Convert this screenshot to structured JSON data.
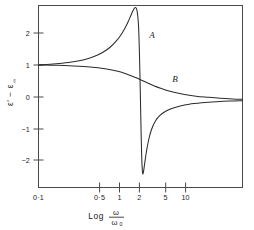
{
  "figure": {
    "title": "",
    "background_color": "#ffffff",
    "line_color": "#2b2b2b",
    "axis_color": "#4a4a4a"
  },
  "axes": {
    "x_title_prefix": "Log",
    "x_numerator": "ω",
    "x_denominator": "ω",
    "x_denominator_subscript": "0",
    "y_title": "ε' − ε",
    "y_title_subscript": "∞",
    "x_tick_labels": [
      "0·1",
      "0·5",
      "1",
      "2",
      "5",
      "10"
    ],
    "y_tick_labels": [
      "2",
      "1",
      "0",
      "−1",
      "−2"
    ]
  },
  "annotations": {
    "curve_a_label": "A",
    "curve_b_label": "B"
  },
  "chart_data": {
    "type": "line",
    "title": "",
    "xlabel": "Log ω/ω₀",
    "ylabel": "ε' − ε∞",
    "x_scale": "log",
    "xlim": [
      0.1,
      10
    ],
    "ylim": [
      -2.5,
      2.7
    ],
    "x_ticks": [
      0.1,
      0.5,
      1,
      2,
      5,
      10
    ],
    "y_ticks": [
      2,
      1,
      0,
      -1,
      -2
    ],
    "grid": false,
    "legend": "inline-labels",
    "series": [
      {
        "name": "A",
        "description": "Resonance absorption dispersion curve with sharp anomalous dispersion at omega/omega0 = 1",
        "label_position": {
          "x": 1.22,
          "y": 1.78
        },
        "x": [
          0.1,
          0.13,
          0.17,
          0.22,
          0.28,
          0.35,
          0.42,
          0.5,
          0.58,
          0.65,
          0.71,
          0.76,
          0.8,
          0.84,
          0.87,
          0.9,
          0.92,
          0.94,
          0.955,
          0.965,
          0.975,
          0.985,
          0.995,
          1.005,
          1.015,
          1.025,
          1.035,
          1.05,
          1.07,
          1.1,
          1.14,
          1.2,
          1.28,
          1.4,
          1.55,
          1.75,
          2.0,
          2.4,
          3.0,
          4.0,
          5.5,
          7.5,
          10.0
        ],
        "y": [
          1.0,
          1.02,
          1.05,
          1.09,
          1.15,
          1.24,
          1.35,
          1.5,
          1.69,
          1.88,
          2.07,
          2.25,
          2.4,
          2.54,
          2.62,
          2.64,
          2.58,
          2.4,
          2.15,
          1.85,
          1.4,
          0.85,
          0.25,
          -0.4,
          -1.0,
          -1.5,
          -1.85,
          -2.1,
          -2.05,
          -1.8,
          -1.5,
          -1.15,
          -0.85,
          -0.6,
          -0.44,
          -0.33,
          -0.25,
          -0.18,
          -0.12,
          -0.08,
          -0.05,
          -0.03,
          -0.02
        ]
      },
      {
        "name": "B",
        "description": "Debye relaxation dispersion curve, monotonic decrease from 1 to 0",
        "label_position": {
          "x": 2.05,
          "y": 0.52
        },
        "x": [
          0.1,
          0.15,
          0.22,
          0.32,
          0.45,
          0.6,
          0.75,
          0.9,
          1.0,
          1.15,
          1.35,
          1.6,
          1.9,
          2.3,
          2.8,
          3.5,
          4.5,
          6.0,
          8.0,
          10.0
        ],
        "y": [
          1.0,
          0.99,
          0.97,
          0.94,
          0.89,
          0.82,
          0.73,
          0.64,
          0.58,
          0.5,
          0.41,
          0.33,
          0.26,
          0.2,
          0.15,
          0.11,
          0.08,
          0.05,
          0.03,
          0.02
        ]
      }
    ]
  }
}
